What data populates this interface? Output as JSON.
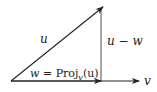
{
  "diagram": {
    "type": "vector-projection",
    "colors": {
      "stroke": "#222222",
      "background": "#ffffff"
    },
    "vectors": {
      "u": {
        "label": "u",
        "from": [
          11,
          81
        ],
        "to": [
          103,
          7
        ]
      },
      "v": {
        "label": "v",
        "from": [
          11,
          81
        ],
        "to": [
          140,
          81
        ]
      },
      "w": {
        "from": [
          11,
          81
        ],
        "to": [
          101,
          81
        ]
      },
      "u_minus_w": {
        "label": "u − w",
        "from": [
          101,
          81
        ],
        "to": [
          101,
          8
        ]
      }
    },
    "labels": {
      "u": "u",
      "v": "v",
      "u_minus_w": "u − w",
      "w_eq": "w = ",
      "proj": "Proj",
      "proj_sub": "v",
      "proj_arg": "(u)"
    }
  }
}
